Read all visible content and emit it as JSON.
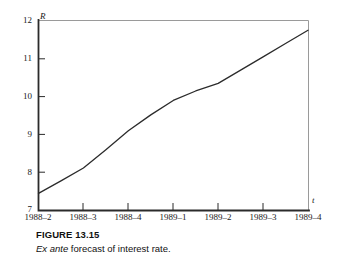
{
  "figure": {
    "caption_title": "FIGURE 13.15",
    "caption_emphasis": "Ex ante",
    "caption_rest": " forecast of interest rate."
  },
  "axes": {
    "y_axis_name": "R",
    "x_axis_name": "t",
    "y_tick_labels": [
      "12",
      "11",
      "10",
      "9",
      "8",
      "7"
    ],
    "x_tick_labels": [
      "1988–2",
      "1988–3",
      "1988–4",
      "1989–1",
      "1989–2",
      "1989–3",
      "1989–4"
    ]
  },
  "colors": {
    "line": "#2b2b2b",
    "axis": "#2b2b2b",
    "frame_light": "#9a9a9a",
    "text": "#1a1a1a",
    "background": "#ffffff"
  },
  "chart_data": {
    "type": "line",
    "title": "Ex ante forecast of interest rate",
    "xlabel": "t",
    "ylabel": "R",
    "categories": [
      "1988–2",
      "1988–3",
      "1988–4",
      "1989–1",
      "1989–2",
      "1989–3",
      "1989–4"
    ],
    "series": [
      {
        "name": "Ex ante forecast of interest rate",
        "values": [
          7.45,
          8.12,
          9.1,
          9.9,
          10.35,
          11.05,
          11.75
        ]
      }
    ],
    "x": [
      0,
      1,
      2,
      3,
      4,
      5,
      6
    ],
    "detailed_points": [
      {
        "t": "1988–2",
        "R": 7.45
      },
      {
        "t": "1988–2.5",
        "R": 7.78
      },
      {
        "t": "1988–3",
        "R": 8.12
      },
      {
        "t": "1988–3.5",
        "R": 8.6
      },
      {
        "t": "1988–4",
        "R": 9.1
      },
      {
        "t": "1988–4.5",
        "R": 9.52
      },
      {
        "t": "1989–1",
        "R": 9.9
      },
      {
        "t": "1989–1.5",
        "R": 10.15
      },
      {
        "t": "1989–2",
        "R": 10.35
      },
      {
        "t": "1989–2.5",
        "R": 10.7
      },
      {
        "t": "1989–3",
        "R": 11.05
      },
      {
        "t": "1989–3.5",
        "R": 11.4
      },
      {
        "t": "1989–4",
        "R": 11.75
      }
    ],
    "ylim": [
      7,
      12
    ],
    "ytick_values": [
      7,
      8,
      9,
      10,
      11,
      12
    ],
    "grid": false,
    "legend": false,
    "markers": false
  }
}
